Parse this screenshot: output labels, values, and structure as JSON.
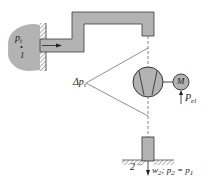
{
  "diagram": {
    "colors": {
      "fill": "#b3b3b3",
      "stroke": "#3a3a3a",
      "background": "#ffffff"
    },
    "labels": {
      "p1_symbol": "p",
      "p1_sub": "t",
      "point1": "1",
      "dp_symbol": "Δp",
      "dp_sub": "t",
      "motor": "M",
      "pel_symbol": "P",
      "pel_sub": "el",
      "point2": "2",
      "outlet_w": "w",
      "outlet_w_sub": "2",
      "outlet_sep": ";",
      "outlet_p": "p",
      "outlet_p_sub": "2",
      "outlet_eq": "=",
      "outlet_p1": "p",
      "outlet_p1_sub": "1"
    },
    "components": [
      "reservoir",
      "inlet-wall",
      "duct",
      "fan",
      "motor",
      "outlet-pipe",
      "floor"
    ]
  }
}
